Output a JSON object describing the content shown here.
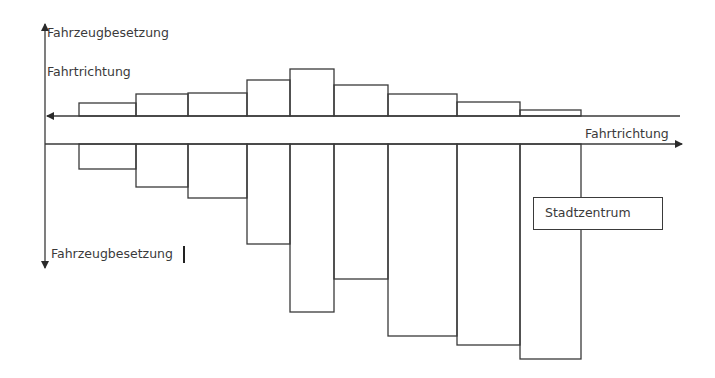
{
  "labels": {
    "y_axis_top": "Fahrzeugbesetzung",
    "direction_top": "Fahrtrichtung",
    "direction_bottom": "Fahrtrichtung",
    "y_axis_bottom": "Fahrzeugbesetzung",
    "city_center": "Stadtzentrum"
  },
  "colors": {
    "line": "#3a3a3a",
    "text": "#3a3a3a",
    "background": "#ffffff"
  },
  "chart_data": {
    "type": "bar",
    "title": "",
    "segments": [
      {
        "x0": 79,
        "x1": 136
      },
      {
        "x0": 136,
        "x1": 188
      },
      {
        "x0": 188,
        "x1": 247
      },
      {
        "x0": 247,
        "x1": 290
      },
      {
        "x0": 290,
        "x1": 334
      },
      {
        "x0": 334,
        "x1": 388
      },
      {
        "x0": 388,
        "x1": 457
      },
      {
        "x0": 457,
        "x1": 520
      },
      {
        "x0": 520,
        "x1": 581
      }
    ],
    "series": [
      {
        "name": "Fahrtrichtung (links)",
        "direction": "up",
        "baseline_y": 116,
        "values": [
          13,
          22,
          23,
          36,
          47,
          31,
          22,
          14,
          6
        ]
      },
      {
        "name": "Fahrtrichtung (rechts)",
        "direction": "down",
        "baseline_y": 144,
        "values": [
          25,
          43,
          54,
          100,
          168,
          135,
          192,
          201,
          215
        ]
      }
    ],
    "xlabel": "Fahrtrichtung",
    "ylabel": "Fahrzeugbesetzung",
    "grid": false,
    "legend": "none"
  }
}
